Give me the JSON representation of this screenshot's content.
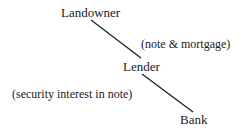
{
  "diagram": {
    "nodes": [
      {
        "id": "landowner",
        "label": "Landowner"
      },
      {
        "id": "lender",
        "label": "Lender"
      },
      {
        "id": "bank",
        "label": "Bank"
      }
    ],
    "edges": [
      {
        "from": "landowner",
        "to": "lender",
        "label": "(note & mortgage)"
      },
      {
        "from": "lender",
        "to": "bank",
        "label": "(security interest in note)"
      }
    ],
    "line_color": "#1a1a1a"
  }
}
